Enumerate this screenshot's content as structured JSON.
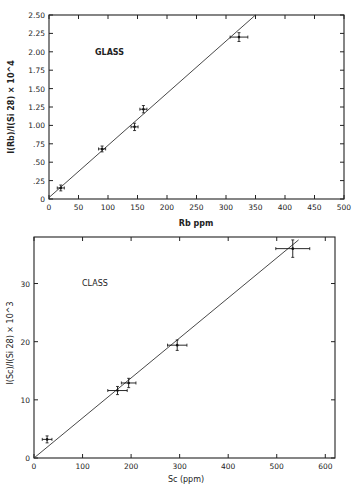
{
  "chart_data": [
    {
      "type": "scatter",
      "title": "",
      "annotation": "GLASS",
      "xlabel": "Rb ppm",
      "ylabel": "I(Rb)/I(Si 28) × 10^4",
      "xlim": [
        0,
        500
      ],
      "ylim": [
        0,
        2.5
      ],
      "xticks": [
        0,
        50,
        100,
        150,
        200,
        250,
        300,
        350,
        400,
        450,
        500
      ],
      "yticks": [
        0,
        0.25,
        0.5,
        0.75,
        1.0,
        1.25,
        1.5,
        1.75,
        2.0,
        2.25,
        2.5
      ],
      "ytick_labels": [
        "0",
        ".25",
        ".50",
        ".75",
        "1.00",
        "1.25",
        "1.50",
        "1.75",
        "2.00",
        "2.25",
        "2.50"
      ],
      "grid": false,
      "series": [
        {
          "name": "data",
          "points": [
            {
              "x": 20,
              "y": 0.15,
              "xerr": 6,
              "yerr": 0.04
            },
            {
              "x": 90,
              "y": 0.68,
              "xerr": 6,
              "yerr": 0.04
            },
            {
              "x": 145,
              "y": 0.98,
              "xerr": 6,
              "yerr": 0.05
            },
            {
              "x": 160,
              "y": 1.22,
              "xerr": 6,
              "yerr": 0.05
            },
            {
              "x": 322,
              "y": 2.2,
              "xerr": 15,
              "yerr": 0.06
            }
          ]
        },
        {
          "name": "fit",
          "type": "line",
          "x": [
            0,
            350
          ],
          "y": [
            0.02,
            2.5
          ]
        }
      ]
    },
    {
      "type": "scatter",
      "title": "",
      "annotation": "CLASS",
      "xlabel": "Sc (ppm)",
      "ylabel": "I(Sc)/I(Si 28) × 10^3",
      "xlim": [
        0,
        620
      ],
      "ylim": [
        0,
        38
      ],
      "xticks": [
        0,
        100,
        200,
        300,
        400,
        500,
        600
      ],
      "yticks": [
        0,
        10,
        20,
        30
      ],
      "grid": false,
      "series": [
        {
          "name": "data",
          "points": [
            {
              "x": 27,
              "y": 3.2,
              "xerr": 10,
              "yerr": 0.6
            },
            {
              "x": 172,
              "y": 11.6,
              "xerr": 20,
              "yerr": 0.7
            },
            {
              "x": 195,
              "y": 12.9,
              "xerr": 15,
              "yerr": 0.8
            },
            {
              "x": 295,
              "y": 19.4,
              "xerr": 20,
              "yerr": 0.9
            },
            {
              "x": 533,
              "y": 36.0,
              "xerr": 35,
              "yerr": 1.5
            }
          ]
        },
        {
          "name": "fit",
          "type": "line",
          "x": [
            0,
            545
          ],
          "y": [
            0,
            37.5
          ]
        }
      ]
    }
  ]
}
